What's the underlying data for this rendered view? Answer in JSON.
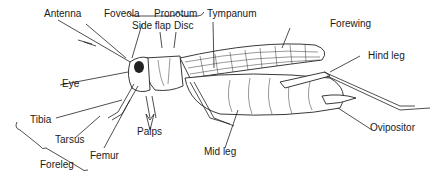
{
  "diagram": {
    "labels": {
      "antenna": "Antenna",
      "foveola": "Foveola",
      "pronotum": "Pronotum",
      "side_flap": "Side flap",
      "disc": "Disc",
      "tympanum": "Tympanum",
      "forewing": "Forewing",
      "hind_leg": "Hind leg",
      "eye": "Eye",
      "tibia": "Tibia",
      "tarsus": "Tarsus",
      "femur": "Femur",
      "palps": "Palps",
      "foreleg": "Foreleg",
      "mid_leg": "Mid leg",
      "ovipositor": "Ovipositor"
    }
  }
}
